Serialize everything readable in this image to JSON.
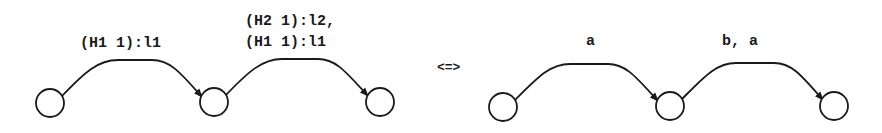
{
  "equivalence_symbol": "<=>",
  "left_graph": {
    "nodes": [
      {
        "id": "L1",
        "cx": 50,
        "cy": 103
      },
      {
        "id": "L2",
        "cx": 214,
        "cy": 102
      },
      {
        "id": "L3",
        "cx": 380,
        "cy": 102
      }
    ],
    "edges": [
      {
        "from": "L1",
        "to": "L2",
        "label_lines": [
          "(H1 1):l1"
        ]
      },
      {
        "from": "L2",
        "to": "L3",
        "label_lines": [
          "(H2 1):l2,",
          "(H1 1):l1"
        ]
      }
    ]
  },
  "right_graph": {
    "nodes": [
      {
        "id": "R1",
        "cx": 503,
        "cy": 107
      },
      {
        "id": "R2",
        "cx": 670,
        "cy": 106
      },
      {
        "id": "R3",
        "cx": 834,
        "cy": 106
      }
    ],
    "edges": [
      {
        "from": "R1",
        "to": "R2",
        "label_lines": [
          "a"
        ]
      },
      {
        "from": "R2",
        "to": "R3",
        "label_lines": [
          "b, a"
        ]
      }
    ]
  },
  "labels": {
    "left_edge1_line1": "(H1 1):l1",
    "left_edge2_line1": "(H2 1):l2,",
    "left_edge2_line2": "(H1 1):l1",
    "right_edge1_line1": "a",
    "right_edge2_line1": "b, a",
    "equivalence": "<=>"
  }
}
